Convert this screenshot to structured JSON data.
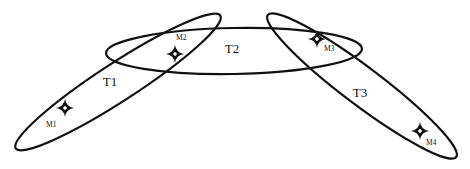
{
  "diagram": {
    "colors": {
      "stroke": "#111111",
      "background": "#ffffff"
    },
    "regions": [
      {
        "id": "T1",
        "label": "T1",
        "cx": 118,
        "cy": 82,
        "rx": 122,
        "ry": 19,
        "rotate": -33,
        "label_x": 110,
        "label_y": 86
      },
      {
        "id": "T2",
        "label": "T2",
        "cx": 234,
        "cy": 51,
        "rx": 128,
        "ry": 23,
        "rotate": -1,
        "label_x": 232,
        "label_y": 53
      },
      {
        "id": "T3",
        "label": "T3",
        "cx": 362,
        "cy": 86,
        "rx": 118,
        "ry": 19,
        "rotate": 37,
        "label_x": 360,
        "label_y": 97
      }
    ],
    "markers": [
      {
        "id": "M1",
        "label": "M1",
        "x": 65,
        "y": 108,
        "label_x": 46,
        "label_y": 127
      },
      {
        "id": "M2",
        "label": "M2",
        "x": 175,
        "y": 54,
        "label_x": 176,
        "label_y": 40
      },
      {
        "id": "M3",
        "label": "M3",
        "x": 317,
        "y": 39,
        "label_x": 324,
        "label_y": 51
      },
      {
        "id": "M4",
        "label": "M4",
        "x": 420,
        "y": 131,
        "label_x": 426,
        "label_y": 145
      }
    ]
  }
}
